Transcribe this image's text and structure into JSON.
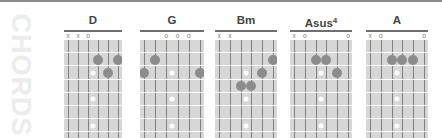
{
  "side_label": "CHORDS",
  "colors": {
    "grid_bg": "#d7d7d7",
    "string": "#808080",
    "fret": "#ffffff",
    "finger_dot": "#8c8c8c",
    "inlay": "#ffffff",
    "side_label": "#ececec"
  },
  "inlay_frets": [
    3,
    5,
    7
  ],
  "chords": [
    {
      "name": "D",
      "sup": "",
      "left": 64,
      "width": 58,
      "open_mute": [
        "x",
        "x",
        "o",
        "",
        "",
        ""
      ],
      "fingers": [
        {
          "string": 4,
          "fret": 2
        },
        {
          "string": 5,
          "fret": 3
        },
        {
          "string": 6,
          "fret": 2
        }
      ]
    },
    {
      "name": "G",
      "sup": "",
      "left": 140,
      "width": 64,
      "open_mute": [
        "",
        "",
        "o",
        "o",
        "o",
        ""
      ],
      "fingers": [
        {
          "string": 1,
          "fret": 3
        },
        {
          "string": 2,
          "fret": 2
        },
        {
          "string": 6,
          "fret": 3
        }
      ]
    },
    {
      "name": "Bm",
      "sup": "",
      "left": 215,
      "width": 62,
      "open_mute": [
        "x",
        "x",
        "",
        "",
        "",
        ""
      ],
      "fingers": [
        {
          "string": 3,
          "fret": 4
        },
        {
          "string": 4,
          "fret": 4
        },
        {
          "string": 5,
          "fret": 3
        },
        {
          "string": 6,
          "fret": 2
        }
      ]
    },
    {
      "name": "Asus",
      "sup": "4",
      "left": 290,
      "width": 62,
      "open_mute": [
        "x",
        "o",
        "",
        "",
        "",
        "o"
      ],
      "fingers": [
        {
          "string": 3,
          "fret": 2
        },
        {
          "string": 4,
          "fret": 2
        },
        {
          "string": 5,
          "fret": 3
        }
      ]
    },
    {
      "name": "A",
      "sup": "",
      "left": 366,
      "width": 62,
      "open_mute": [
        "x",
        "o",
        "",
        "",
        "",
        "o"
      ],
      "fingers": [
        {
          "string": 3,
          "fret": 2
        },
        {
          "string": 4,
          "fret": 2
        },
        {
          "string": 5,
          "fret": 2
        }
      ]
    }
  ]
}
